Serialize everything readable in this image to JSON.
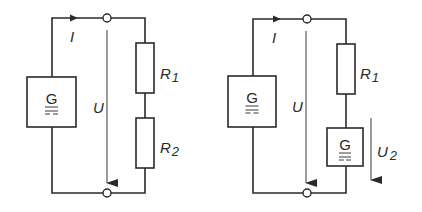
{
  "diagram": {
    "type": "circuit-schematic",
    "circuits": [
      {
        "name": "left",
        "source_label": "G",
        "current_label": "I",
        "voltage_label": "U",
        "components": [
          {
            "kind": "resistor",
            "label": "R",
            "subscript": "1"
          },
          {
            "kind": "resistor",
            "label": "R",
            "subscript": "2"
          }
        ]
      },
      {
        "name": "right",
        "source_label": "G",
        "current_label": "I",
        "voltage_label": "U",
        "components": [
          {
            "kind": "resistor",
            "label": "R",
            "subscript": "1"
          },
          {
            "kind": "generator",
            "label": "G",
            "voltage_label": "U",
            "voltage_subscript": "2"
          }
        ]
      }
    ]
  }
}
